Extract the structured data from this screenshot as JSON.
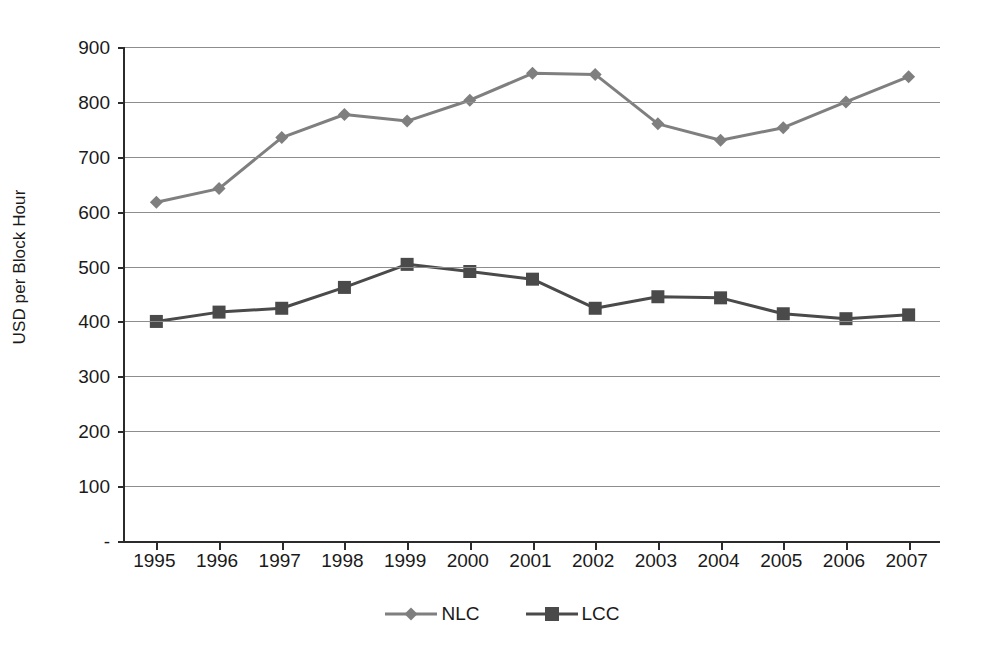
{
  "chart_data": {
    "type": "line",
    "title": "",
    "xlabel": "",
    "ylabel": "USD per Block Hour",
    "categories": [
      "1995",
      "1996",
      "1997",
      "1998",
      "1999",
      "2000",
      "2001",
      "2002",
      "2003",
      "2004",
      "2005",
      "2006",
      "2007"
    ],
    "x": [
      1995,
      1996,
      1997,
      1998,
      1999,
      2000,
      2001,
      2002,
      2003,
      2004,
      2005,
      2006,
      2007
    ],
    "series": [
      {
        "name": "NLC",
        "marker": "diamond",
        "color": "#7f7f7f",
        "values": [
          617,
          642,
          735,
          777,
          765,
          803,
          852,
          850,
          760,
          730,
          753,
          800,
          846
        ]
      },
      {
        "name": "LCC",
        "marker": "square",
        "color": "#4a4a4a",
        "values": [
          400,
          417,
          424,
          462,
          504,
          491,
          477,
          424,
          445,
          443,
          414,
          405,
          412
        ]
      }
    ],
    "ylim": [
      0,
      900
    ],
    "ytick_values": [
      0,
      100,
      200,
      300,
      400,
      500,
      600,
      700,
      800,
      900
    ],
    "ytick_labels": [
      "-",
      "100",
      "200",
      "300",
      "400",
      "500",
      "600",
      "700",
      "800",
      "900"
    ],
    "grid": true,
    "legend_position": "bottom"
  },
  "legend": {
    "items": [
      {
        "label": "NLC"
      },
      {
        "label": "LCC"
      }
    ]
  },
  "axis": {
    "y_title": "USD per Block Hour"
  },
  "colors": {
    "nlc": "#7f7f7f",
    "lcc": "#4a4a4a",
    "gridline": "#8d8d8d",
    "axis": "#2b2b2b",
    "background": "#ffffff",
    "text": "#1a1a1a"
  }
}
